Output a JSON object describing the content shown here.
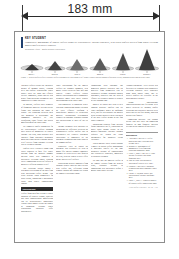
{
  "measurement": {
    "label": "183 mm",
    "unit": "mm",
    "value": 183,
    "arrow_left_icon": "arrow-left-icon",
    "arrow_right_icon": "arrow-right-icon"
  },
  "masthead": {
    "kicker": "KEY STUDENT",
    "deck": "Comparative morphology of conical edifices across six representative volcanic provinces, with scaled profiles derived from digital elevation models and field survey transects.",
    "byline": "Research Article  ·  Earth Surface Processes"
  },
  "figure": {
    "caption": "Figure 1. Scaled profiles of six volcanic edifices arranged by increasing relief. Basal ellipses indicate mapped footprint extent; shading denotes mean slope class.",
    "cones": [
      {
        "label": "Shield A",
        "height": 6,
        "width": 15,
        "base_w": 21,
        "base_h": 4.0,
        "tone": "#3a3a3a"
      },
      {
        "label": "Dome B",
        "height": 9,
        "width": 14,
        "base_w": 19,
        "base_h": 3.6,
        "tone": "#444444"
      },
      {
        "label": "Cone C",
        "height": 11,
        "width": 15,
        "base_w": 20,
        "base_h": 3.6,
        "tone": "#6e6e6e"
      },
      {
        "label": "Strato D",
        "height": 12,
        "width": 14,
        "base_w": 19,
        "base_h": 3.4,
        "tone": "#5a5a5a"
      },
      {
        "label": "Peak E",
        "height": 17,
        "width": 15,
        "base_w": 20,
        "base_h": 3.4,
        "tone": "#4a4a4a"
      },
      {
        "label": "Summit F",
        "height": 21,
        "width": 16,
        "base_w": 22,
        "base_h": 3.6,
        "tone": "#3f3f3f"
      }
    ]
  },
  "columns": [
    {
      "paragraphs": [
        "Volcanic edifices record the integrated history of magma supply, eruption style and surface degradation. Where supply rates are high and effusive activity dominates, broad shields with gentle flank gradients accumulate over comparatively short intervals.",
        "In contrast, edifices built primarily of fragmental material develop steeper flanks that approach the angle of repose. The transition between these end members is gradational and commonly obscured by later resurfacing, slope failure and glacial modification of the upper cone.",
        "We compiled profile geometries for six representative edifices spanning three orders of magnitude in erupted volume. For each, basal outlines were digitised from published geological maps and cross checked against shaded relief derived from regional elevation data at ten metre posting.",
        "Profiles were extracted along eight radial transects at forty five degree spacing from the mapped summit. Median slope was computed in successive elevation bands, allowing direct comparison between edifices of markedly different absolute relief.",
        "The resulting dataset shows a systematic steepening of the mid flank with increasing edifice height. This trend persists when normalised for basal radius, suggesting a mechanical rather than purely constructional control."
      ],
      "subhead": "Conclusions",
      "closing": "Edifice form therefore retains a legible signature of eruptive regime, provided that post constructional modification can be independently constrained. Further work should extend the sample to submarine settings where degradation pathways differ substantially."
    },
    {
      "paragraphs": [
        "Slope distributions for the smaller edifices are strongly unimodal, with modal values between four and nine degrees. Larger edifices display broader distributions and a pronounced secondary mode near thirty degrees corresponding to the upper cone.",
        "This bimodality is consistent with a two stage construction history in which an early effusive platform is subsequently mantled by pyroclastic material. Stratigraphic relationships exposed in erosional windows support this interpretation at three of the six sites.",
        "Volume estimates were obtained by integrating the difference between the reconstructed edifice surface and an interpolated pre eruptive basement. Uncertainty is dominated by the basement reconstruction rather than by the summit surface.",
        "Sensitivity tests in which the basement was perturbed by plus or minus fifty metres changed computed volumes by between six and fourteen per cent, with the largest relative effect on the lowest relief edifices.",
        "Degradation indices computed from drainage density correlate only weakly with edifice age, reflecting strong climatic control on erosion rate across the sampled latitudinal range."
      ]
    },
    {
      "paragraphs": [
        "Comparison with analogue and numerical models indicates that the observed flank geometries can be reproduced without invoking unusual rheologies, provided that the ratio of effusive to explosive output is allowed to vary through time.",
        "Models in which this ratio is held constant generate profiles that are either uniformly gentle or uniformly steep, and fail to reproduce the marked break in slope observed near two thirds of the total edifice height in the four larger examples.",
        "Introducing episodic flank collapse further improves the fit, producing the subtle basal aprons visible in the mapped footprints. Collapse volumes required are within the range documented for historical events elsewhere.",
        "Taken together these results support a model in which edifice morphology is governed chiefly by the time integrated balance of constructional and destructive processes, modulated by substrate strength.",
        "We note that the smallest edifice in the sample departs from the general trend, plausibly because its construction was interrupted before a mature cone could develop."
      ]
    },
    {
      "paragraphs": [
        "Acknowledgements. Field access was facilitated by regional park authorities. Elevation products were processed using open source tools, and all derived profiles are available in the supplementary archive.",
        "Author contributions. Conceptualisation and fieldwork were shared between all authors; profile extraction and statistical analysis were carried out by the first author, who also prepared the figures.",
        "Competing interests. The authors declare that they have no competing financial or non financial interests relevant to the content of this article."
      ],
      "references": {
        "title": "References",
        "items": [
          "Anderson R. and Pike S. Edifice growth and slope evolution in arc settings. 2019.",
          "Bremner K. Morphometry of monogenetic fields from high resolution topography. 2020.",
          "Clarke J., Mori T. and Vale P. Flank collapse recurrence and apron formation. 2017.",
          "Dahl M. Slope distributions as indicators of eruptive style. 2021.",
          "Esposito L. and Hart R. Basement reconstruction under composite cones. 2018.",
          "Farrow N. Drainage density and degradation of volcanic landforms. 2016.",
          "Gould A., Rhee C. Numerical models of episodic edifice construction. 2022."
        ]
      },
      "footline": "Earth Surface Processes  ·  Vol. 48  ·  1147"
    }
  ]
}
